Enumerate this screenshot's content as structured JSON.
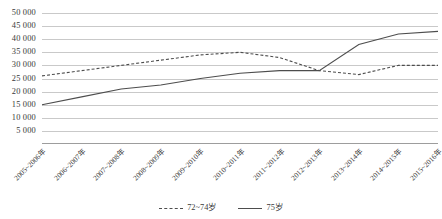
{
  "chart_data": {
    "type": "line",
    "title": "",
    "xlabel": "",
    "ylabel": "",
    "categories": [
      "2005~2006年",
      "2006~2007年",
      "2007~2008年",
      "2008~2009年",
      "2009~2010年",
      "2010~2011年",
      "2011~2012年",
      "2012~2013年",
      "2013~2014年",
      "2014~2015年",
      "2015~2016年"
    ],
    "series": [
      {
        "name": "72~74岁",
        "style": "dashed",
        "color": "#4d4d4d",
        "values": [
          26000,
          28000,
          30000,
          32000,
          34000,
          35000,
          33000,
          28000,
          26500,
          30000,
          30000
        ]
      },
      {
        "name": "75岁",
        "style": "solid",
        "color": "#4d4d4d",
        "values": [
          15000,
          18000,
          21000,
          22500,
          25000,
          27000,
          28000,
          28000,
          38000,
          42000,
          43000
        ]
      }
    ],
    "ylim": [
      0,
      50000
    ],
    "ytick_step": 5000,
    "ytick_labels": [
      "50 000",
      "45 000",
      "40 000",
      "35 000",
      "30 000",
      "25 000",
      "20 000",
      "15 000",
      "10 000",
      "5 000",
      ""
    ],
    "ytick_values": [
      50000,
      45000,
      40000,
      35000,
      30000,
      25000,
      20000,
      15000,
      10000,
      5000,
      0
    ],
    "grid": true,
    "grid_color": "#c9c9c9",
    "legend_position": "bottom"
  }
}
